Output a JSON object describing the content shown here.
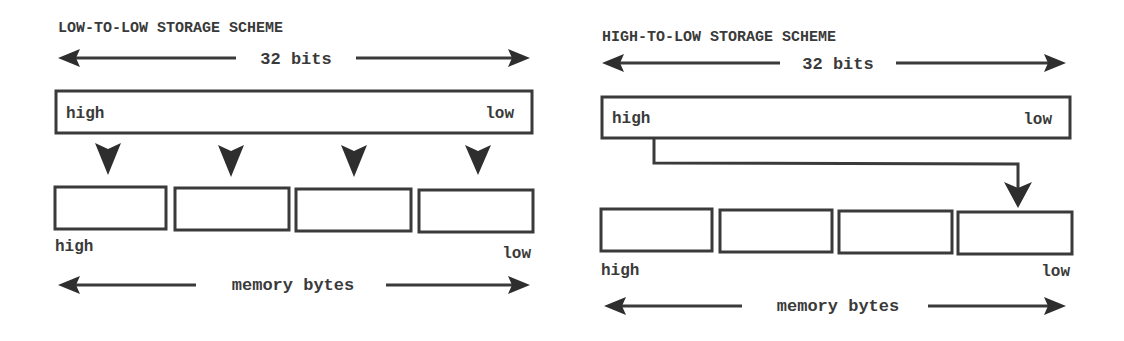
{
  "colors": {
    "ink": "#3a3a3a",
    "background": "#ffffff"
  },
  "left_panel": {
    "title": "LOW-TO-LOW STORAGE SCHEME",
    "width_label": "32 bits",
    "register": {
      "high_label": "high",
      "low_label": "low"
    },
    "byte_count": 4,
    "bytes_high_label": "high",
    "bytes_low_label": "low",
    "memory_label": "memory bytes"
  },
  "right_panel": {
    "title": "HIGH-TO-LOW STORAGE SCHEME",
    "width_label": "32 bits",
    "register": {
      "high_label": "high",
      "low_label": "low"
    },
    "byte_count": 4,
    "bytes_high_label": "high",
    "bytes_low_label": "low",
    "memory_label": "memory bytes"
  }
}
